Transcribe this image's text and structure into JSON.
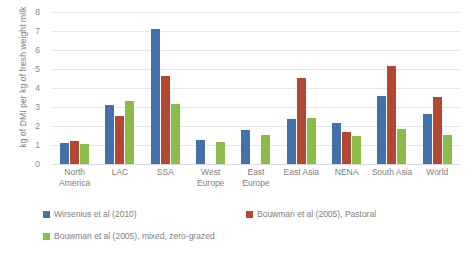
{
  "chart_data": {
    "type": "bar",
    "title": "",
    "xlabel": "",
    "ylabel": "kg of DMI per kg of fresh weight milk",
    "ylim": [
      0,
      8
    ],
    "ytick_labels": [
      "0",
      "1",
      "2",
      "3",
      "4",
      "5",
      "6",
      "7",
      "8"
    ],
    "yticks": [
      0,
      1,
      2,
      3,
      4,
      5,
      6,
      7,
      8
    ],
    "grid": true,
    "legend_position": "bottom",
    "categories": [
      "North America",
      "LAC",
      "SSA",
      "West Europe",
      "East Europe",
      "East Asia",
      "NENA",
      "South Asia",
      "World"
    ],
    "series": [
      {
        "name": "Wirsenius et al (2010)",
        "color": "#4472a8",
        "values": [
          1.1,
          3.1,
          7.1,
          1.25,
          1.8,
          2.35,
          2.15,
          3.6,
          2.65
        ]
      },
      {
        "name": "Bouwman et al (2005), Pastoral",
        "color": "#b4472f",
        "values": [
          1.2,
          2.55,
          4.65,
          null,
          null,
          4.55,
          1.7,
          5.15,
          3.55
        ]
      },
      {
        "name": "Bouwman et al (2005), mixed, zero-grazed",
        "color": "#8bbc4a",
        "values": [
          1.05,
          3.3,
          3.15,
          1.15,
          1.55,
          2.4,
          1.45,
          1.85,
          1.55
        ]
      }
    ]
  }
}
